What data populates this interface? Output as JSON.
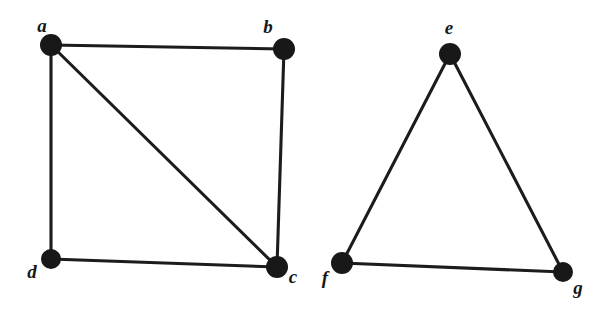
{
  "figure": {
    "title": "",
    "background_color": "#ffffff",
    "ink_color": "#1c1c1c",
    "node_color": "#181818",
    "node_radius": 10,
    "edge_width": 3.1
  },
  "graphs": [
    {
      "name": "left-graph",
      "shape": "square-with-diagonal",
      "vertices": [
        {
          "id": "a",
          "label": "a",
          "cx": 51,
          "cy": 45,
          "r": 11,
          "label_x": 42,
          "label_y": 28
        },
        {
          "id": "b",
          "label": "b",
          "cx": 284,
          "cy": 49,
          "r": 11,
          "label_x": 268,
          "label_y": 29
        },
        {
          "id": "c",
          "label": "c",
          "cx": 277,
          "cy": 267,
          "r": 11,
          "label_x": 293,
          "label_y": 279
        },
        {
          "id": "d",
          "label": "d",
          "cx": 51,
          "cy": 259,
          "r": 10,
          "label_x": 32,
          "label_y": 274
        }
      ],
      "edges": [
        {
          "from": "a",
          "to": "b"
        },
        {
          "from": "a",
          "to": "d"
        },
        {
          "from": "a",
          "to": "c"
        },
        {
          "from": "b",
          "to": "c"
        },
        {
          "from": "d",
          "to": "c"
        }
      ]
    },
    {
      "name": "right-graph",
      "shape": "triangle",
      "vertices": [
        {
          "id": "e",
          "label": "e",
          "cx": 450,
          "cy": 54,
          "r": 11,
          "label_x": 449,
          "label_y": 30
        },
        {
          "id": "f",
          "label": "f",
          "cx": 342,
          "cy": 263,
          "r": 11,
          "label_x": 325,
          "label_y": 280
        },
        {
          "id": "g",
          "label": "g",
          "cx": 563,
          "cy": 272,
          "r": 10,
          "label_x": 578,
          "label_y": 290
        }
      ],
      "edges": [
        {
          "from": "e",
          "to": "f"
        },
        {
          "from": "e",
          "to": "g"
        },
        {
          "from": "f",
          "to": "g"
        }
      ]
    }
  ]
}
